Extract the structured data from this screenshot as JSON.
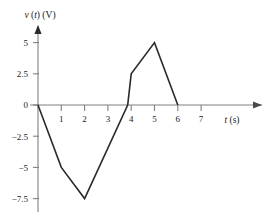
{
  "chart_data": {
    "type": "line",
    "title": "",
    "subtitle": "",
    "xlabel": "t (s)",
    "xlabel_italic_part": "t",
    "xlabel_rest": " (s)",
    "ylabel": "v (t) (V)",
    "ylabel_italic_v": "v",
    "ylabel_paren_open": " (",
    "ylabel_italic_t": "t",
    "ylabel_rest": ") (V)",
    "x": [
      0,
      1,
      2,
      3.85,
      4,
      5,
      6
    ],
    "values": [
      0,
      -5,
      -7.5,
      0,
      2.5,
      5,
      0
    ],
    "series": [
      {
        "name": "v(t)",
        "points": [
          {
            "x": 0,
            "y": 0
          },
          {
            "x": 1,
            "y": -5
          },
          {
            "x": 2,
            "y": -7.5
          },
          {
            "x": 3.85,
            "y": 0
          },
          {
            "x": 4,
            "y": 2.5
          },
          {
            "x": 5,
            "y": 5
          },
          {
            "x": 6,
            "y": 0
          }
        ],
        "color": "#2b2b2b"
      }
    ],
    "xlim": [
      0,
      7.6
    ],
    "ylim": [
      -7.5,
      5
    ],
    "xticks": [
      1,
      2,
      3,
      4,
      5,
      6,
      7
    ],
    "xtick_labels": [
      "1",
      "2",
      "3",
      "4",
      "5",
      "6",
      "7"
    ],
    "yticks": [
      5,
      2.5,
      0,
      -2.5,
      -5,
      -7.5
    ],
    "ytick_labels": [
      "5",
      "2.5",
      "0",
      "−2.5",
      "−5",
      "−7.5"
    ],
    "grid": false,
    "legend": null,
    "legend_position": "none",
    "axis_arrows": true,
    "annotations": []
  },
  "axis_colors": {
    "axis_line": "#808080",
    "curve": "#2b2b2b",
    "text": "#1a1a1a"
  }
}
